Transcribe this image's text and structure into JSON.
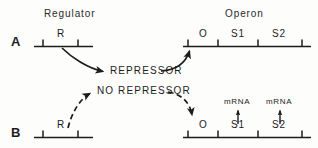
{
  "figure": {
    "title_hidden": "Operon model of gene regulation",
    "columns": [
      {
        "label": "Regulator"
      },
      {
        "label": "Operon"
      }
    ],
    "rows": [
      {
        "letter": "A",
        "state_label": "REPRESSOR",
        "regulator": {
          "gene_label": "R"
        },
        "operon": {
          "segments": [
            {
              "label": "O"
            },
            {
              "label": "S1"
            },
            {
              "label": "S2"
            }
          ],
          "transcripts": []
        },
        "arrow_style": "solid"
      },
      {
        "letter": "B",
        "state_label": "NO REPRESSOR",
        "regulator": {
          "gene_label": "R"
        },
        "operon": {
          "segments": [
            {
              "label": "O"
            },
            {
              "label": "S1"
            },
            {
              "label": "S2"
            }
          ],
          "transcripts": [
            {
              "label": "mRNA",
              "over_segment": "S1"
            },
            {
              "label": "mRNA",
              "over_segment": "S2"
            }
          ]
        },
        "arrow_style": "dashed"
      }
    ],
    "colors": {
      "ink": "#1c1c1c",
      "background": "#fdfdfc"
    }
  }
}
